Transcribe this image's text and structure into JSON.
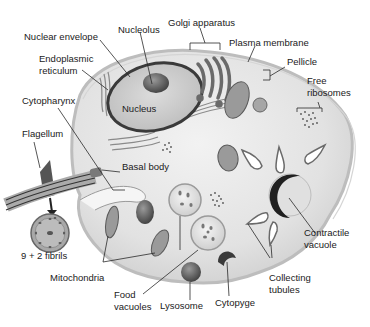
{
  "diagram": {
    "colors": {
      "background": "#ffffff",
      "cytoplasm": "#e6e6e6",
      "membrane": "#b8b8b8",
      "nucleus_envelope": "#3a3a3a",
      "organelle_dark": "#6a6a6a",
      "leader_line": "#2a2a2a",
      "text": "#1a1a1a"
    },
    "labels": {
      "nuclear_envelope": "Nuclear envelope",
      "nucleolus": "Nucleolus",
      "golgi_apparatus": "Golgi apparatus",
      "plasma_membrane": "Plasma membrane",
      "pellicle": "Pellicle",
      "endoplasmic_reticulum_1": "Endoplasmic",
      "endoplasmic_reticulum_2": "reticulum",
      "free_ribosomes_1": "Free",
      "free_ribosomes_2": "ribosomes",
      "cytopharynx": "Cytopharynx",
      "nucleus": "Nucleus",
      "flagellum": "Flagellum",
      "basal_body": "Basal body",
      "fibrils": "9 + 2 fibrils",
      "mitochondria": "Mitochondria",
      "food_vacuoles_1": "Food",
      "food_vacuoles_2": "vacuoles",
      "lysosome": "Lysosome",
      "cytopyge": "Cytopyge",
      "collecting_tubules_1": "Collecting",
      "collecting_tubules_2": "tubules",
      "contractile_vacuole_1": "Contractile",
      "contractile_vacuole_2": "vacuole"
    }
  }
}
